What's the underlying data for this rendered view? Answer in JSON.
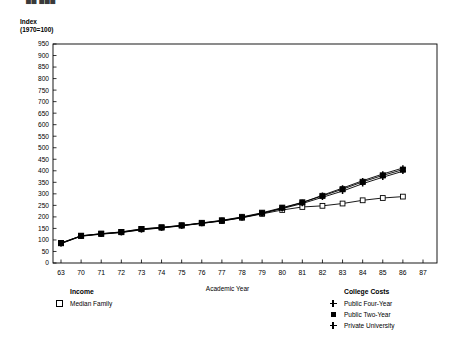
{
  "clipped_header": "██ ███",
  "chart_data": {
    "type": "line",
    "title": "",
    "xlabel": "Academic Year",
    "ylabel": "Index\n(1970=100)",
    "ylabel_line1": "Index",
    "ylabel_line2": "(1970=100)",
    "ylim": [
      0,
      950
    ],
    "ytick_step": 50,
    "yticks": [
      0,
      50,
      100,
      150,
      200,
      250,
      300,
      350,
      400,
      450,
      500,
      550,
      600,
      650,
      700,
      750,
      800,
      850,
      900,
      950
    ],
    "categories": [
      "63",
      "70",
      "71",
      "72",
      "73",
      "74",
      "75",
      "76",
      "77",
      "78",
      "79",
      "80",
      "81",
      "82",
      "83",
      "84",
      "85",
      "86",
      "87"
    ],
    "x": [
      63,
      70,
      71,
      72,
      73,
      74,
      75,
      76,
      77,
      78,
      79,
      80,
      81,
      82,
      83,
      84,
      85,
      86,
      87
    ],
    "grid": false,
    "legend_position": "below-plot",
    "series": [
      {
        "name": "Median Family",
        "group": "Income",
        "marker": "open-square",
        "values": [
          87,
          118,
          127,
          135,
          148,
          155,
          163,
          172,
          182,
          196,
          213,
          230,
          243,
          248,
          258,
          272,
          282,
          288,
          null
        ]
      },
      {
        "name": "Public Four-Year",
        "group": "College Costs",
        "marker": "cross",
        "values": [
          85,
          117,
          126,
          133,
          145,
          153,
          162,
          173,
          184,
          198,
          216,
          236,
          258,
          285,
          312,
          344,
          372,
          398,
          null
        ]
      },
      {
        "name": "Public Two-Year",
        "group": "College Costs",
        "marker": "filled-square",
        "values": [
          86,
          118,
          127,
          134,
          147,
          154,
          163,
          174,
          185,
          200,
          218,
          240,
          263,
          291,
          320,
          352,
          380,
          405,
          null
        ]
      },
      {
        "name": "Private University",
        "group": "College Costs",
        "marker": "cross",
        "values": [
          84,
          116,
          125,
          132,
          144,
          152,
          161,
          172,
          183,
          197,
          215,
          238,
          262,
          294,
          325,
          357,
          386,
          412,
          null
        ]
      }
    ]
  },
  "legend": {
    "income": {
      "title": "Income",
      "items": [
        {
          "label": "Median Family",
          "marker": "open-square"
        }
      ]
    },
    "costs": {
      "title": "College Costs",
      "items": [
        {
          "label": "Public Four-Year",
          "marker": "cross"
        },
        {
          "label": "Public Two-Year",
          "marker": "filled-square"
        },
        {
          "label": "Private University",
          "marker": "cross"
        }
      ]
    }
  },
  "colors": {
    "line": "#000000",
    "axis": "#000000",
    "background": "#ffffff"
  }
}
